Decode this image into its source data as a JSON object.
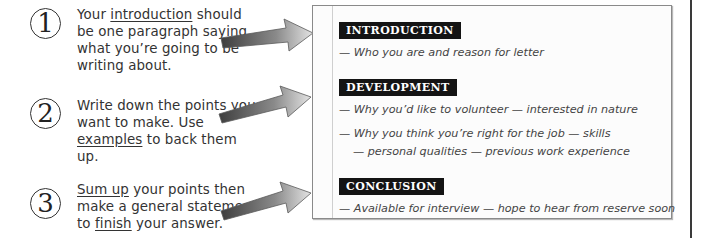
{
  "steps": [
    {
      "number": "1",
      "text_parts": [
        "Your ",
        "introduction",
        " should be one paragraph saying what you’re going to be writing about."
      ]
    },
    {
      "number": "2",
      "text_parts": [
        "Write down the points you want to make.  Use ",
        "examples",
        " to back them up."
      ]
    },
    {
      "number": "3",
      "text_parts": [
        "Sum up",
        " your points then make a general statement to ",
        "finish",
        " your answer."
      ]
    }
  ],
  "plan": {
    "sections": [
      {
        "heading": "INTRODUCTION",
        "notes": [
          "— Who you are and reason for letter"
        ]
      },
      {
        "heading": "DEVELOPMENT",
        "notes": [
          "— Why you’d like to volunteer — interested in nature",
          "— Why you think you’re right for the job — skills",
          "— personal qualities — previous work experience"
        ]
      },
      {
        "heading": "CONCLUSION",
        "notes": [
          "— Available for interview — hope to hear from reserve soon"
        ]
      }
    ]
  },
  "colors": {
    "heading_bg": "#141414",
    "heading_text": "#ffffff",
    "arrow_dark": "#4a4a4a",
    "arrow_light": "#d8d8d8",
    "panel_border": "#8a8a8a"
  }
}
